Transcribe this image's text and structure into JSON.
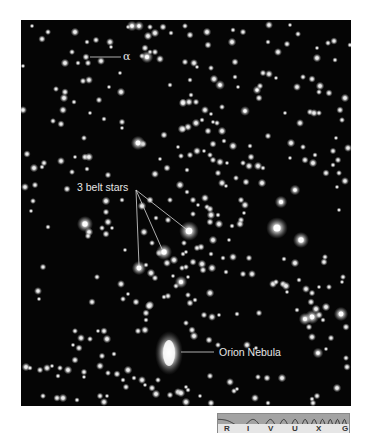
{
  "figure": {
    "labels": {
      "alpha": "α",
      "belt_stars": "3 belt stars",
      "nebula": "Orion Nebula"
    },
    "spectrum_bar": {
      "bands": [
        {
          "label": "R",
          "x": 6
        },
        {
          "label": "I",
          "x": 29
        },
        {
          "label": "V",
          "x": 50
        },
        {
          "label": "U",
          "x": 74
        },
        {
          "label": "X",
          "x": 98
        },
        {
          "label": "G",
          "x": 124
        }
      ],
      "colors": {
        "wave_bg": "#a3a3a3",
        "label_bg": "#e6e6e6",
        "wave_line": "#2a2a2a"
      }
    },
    "colors": {
      "sky": "#050505",
      "star": "#ffffff",
      "annotation": "#e6e6e6"
    },
    "bright_stars": [
      [
        189,
        231,
        5.5
      ],
      [
        164,
        252,
        4.5
      ],
      [
        139,
        268,
        4
      ],
      [
        277,
        228,
        6
      ],
      [
        301,
        240,
        4.5
      ],
      [
        281,
        202,
        3.5
      ],
      [
        295,
        190,
        3
      ],
      [
        85,
        224,
        4.5
      ],
      [
        147,
        57,
        3.5
      ],
      [
        138,
        143,
        4
      ],
      [
        312,
        317,
        4
      ],
      [
        305,
        319,
        3.5
      ],
      [
        341,
        314,
        4
      ],
      [
        181,
        282,
        3.5
      ],
      [
        132,
        26,
        3
      ],
      [
        318,
        353,
        3
      ],
      [
        139,
        26,
        2.8
      ],
      [
        257,
        90,
        2.5
      ],
      [
        245,
        111,
        2.8
      ],
      [
        220,
        85,
        2.8
      ]
    ],
    "stars": [
      [
        32,
        26
      ],
      [
        48,
        32
      ],
      [
        42,
        39
      ],
      [
        75,
        32
      ],
      [
        87,
        42
      ],
      [
        96,
        40
      ],
      [
        110,
        42
      ],
      [
        111,
        47
      ],
      [
        72,
        52
      ],
      [
        86,
        57
      ],
      [
        65,
        63
      ],
      [
        78,
        63
      ],
      [
        88,
        63
      ],
      [
        101,
        61
      ],
      [
        120,
        73
      ],
      [
        142,
        56
      ],
      [
        145,
        48
      ],
      [
        148,
        36
      ],
      [
        150,
        52
      ],
      [
        155,
        52
      ],
      [
        160,
        59
      ],
      [
        128,
        27
      ],
      [
        150,
        27
      ],
      [
        163,
        27
      ],
      [
        155,
        33
      ],
      [
        171,
        33
      ],
      [
        83,
        81
      ],
      [
        89,
        80
      ],
      [
        109,
        87
      ],
      [
        56,
        89
      ],
      [
        65,
        92
      ],
      [
        64,
        98
      ],
      [
        74,
        102
      ],
      [
        99,
        100
      ],
      [
        63,
        110
      ],
      [
        90,
        113
      ],
      [
        53,
        121
      ],
      [
        61,
        124
      ],
      [
        121,
        92
      ],
      [
        170,
        85
      ],
      [
        183,
        102
      ],
      [
        189,
        102
      ],
      [
        122,
        128
      ],
      [
        84,
        138
      ],
      [
        164,
        135
      ],
      [
        182,
        129
      ],
      [
        104,
        119
      ],
      [
        122,
        122
      ],
      [
        23,
        110
      ],
      [
        23,
        66
      ],
      [
        185,
        26
      ],
      [
        190,
        35
      ],
      [
        207,
        32
      ],
      [
        233,
        30
      ],
      [
        243,
        32
      ],
      [
        269,
        25
      ],
      [
        290,
        25
      ],
      [
        298,
        34
      ],
      [
        208,
        45
      ],
      [
        232,
        42
      ],
      [
        268,
        42
      ],
      [
        287,
        44
      ],
      [
        278,
        52
      ],
      [
        317,
        48
      ],
      [
        328,
        43
      ],
      [
        334,
        41
      ],
      [
        317,
        58
      ],
      [
        335,
        60
      ],
      [
        185,
        62
      ],
      [
        194,
        63
      ],
      [
        197,
        67
      ],
      [
        211,
        68
      ],
      [
        235,
        62
      ],
      [
        214,
        79
      ],
      [
        235,
        77
      ],
      [
        263,
        73
      ],
      [
        269,
        74
      ],
      [
        276,
        78
      ],
      [
        303,
        77
      ],
      [
        312,
        79
      ],
      [
        320,
        86
      ],
      [
        190,
        80
      ],
      [
        260,
        86
      ],
      [
        297,
        87
      ],
      [
        238,
        87
      ],
      [
        319,
        92
      ],
      [
        329,
        93
      ],
      [
        183,
        103
      ],
      [
        191,
        95
      ],
      [
        196,
        102
      ],
      [
        205,
        110
      ],
      [
        211,
        114
      ],
      [
        222,
        107
      ],
      [
        259,
        98
      ],
      [
        196,
        123
      ],
      [
        202,
        120
      ],
      [
        183,
        129
      ],
      [
        188,
        127
      ],
      [
        213,
        122
      ],
      [
        217,
        123
      ],
      [
        208,
        131
      ],
      [
        222,
        131
      ],
      [
        224,
        141
      ],
      [
        268,
        136
      ],
      [
        300,
        123
      ],
      [
        336,
        138
      ],
      [
        342,
        120
      ],
      [
        340,
        110
      ],
      [
        345,
        98
      ],
      [
        350,
        45
      ],
      [
        310,
        112
      ],
      [
        314,
        113
      ],
      [
        285,
        113
      ],
      [
        319,
        113
      ],
      [
        27,
        154
      ],
      [
        34,
        168
      ],
      [
        42,
        167
      ],
      [
        44,
        163
      ],
      [
        61,
        161
      ],
      [
        75,
        157
      ],
      [
        72,
        172
      ],
      [
        85,
        157
      ],
      [
        89,
        157
      ],
      [
        87,
        169
      ],
      [
        108,
        175
      ],
      [
        143,
        144
      ],
      [
        178,
        147
      ],
      [
        181,
        156
      ],
      [
        167,
        168
      ],
      [
        180,
        185
      ],
      [
        187,
        170
      ],
      [
        35,
        185
      ],
      [
        25,
        187
      ],
      [
        31,
        211
      ],
      [
        33,
        201
      ],
      [
        67,
        189
      ],
      [
        106,
        201
      ],
      [
        122,
        200
      ],
      [
        106,
        212
      ],
      [
        108,
        222
      ],
      [
        112,
        228
      ],
      [
        102,
        228
      ],
      [
        106,
        234
      ],
      [
        89,
        232
      ],
      [
        48,
        227
      ],
      [
        88,
        236
      ],
      [
        155,
        174
      ],
      [
        160,
        159
      ],
      [
        170,
        200
      ],
      [
        150,
        200
      ],
      [
        142,
        206
      ],
      [
        156,
        218
      ],
      [
        168,
        220
      ],
      [
        144,
        232
      ],
      [
        125,
        250
      ],
      [
        152,
        243
      ],
      [
        159,
        253
      ],
      [
        174,
        260
      ],
      [
        183,
        254
      ],
      [
        190,
        155
      ],
      [
        197,
        151
      ],
      [
        204,
        151
      ],
      [
        210,
        155
      ],
      [
        213,
        144
      ],
      [
        233,
        146
      ],
      [
        250,
        146
      ],
      [
        213,
        160
      ],
      [
        220,
        162
      ],
      [
        227,
        163
      ],
      [
        243,
        163
      ],
      [
        251,
        157
      ],
      [
        258,
        166
      ],
      [
        263,
        168
      ],
      [
        218,
        173
      ],
      [
        222,
        183
      ],
      [
        226,
        186
      ],
      [
        236,
        178
      ],
      [
        246,
        182
      ],
      [
        262,
        183
      ],
      [
        187,
        192
      ],
      [
        193,
        200
      ],
      [
        205,
        198
      ],
      [
        198,
        205
      ],
      [
        207,
        207
      ],
      [
        210,
        209
      ],
      [
        211,
        215
      ],
      [
        218,
        215
      ],
      [
        241,
        200
      ],
      [
        245,
        205
      ],
      [
        244,
        213
      ],
      [
        193,
        214
      ],
      [
        210,
        222
      ],
      [
        219,
        224
      ],
      [
        232,
        226
      ],
      [
        241,
        220
      ],
      [
        240,
        224
      ],
      [
        229,
        240
      ],
      [
        184,
        243
      ],
      [
        201,
        247
      ],
      [
        213,
        240
      ],
      [
        211,
        254
      ],
      [
        197,
        248
      ],
      [
        233,
        257
      ],
      [
        186,
        252
      ],
      [
        182,
        268
      ],
      [
        193,
        262
      ],
      [
        202,
        264
      ],
      [
        223,
        258
      ],
      [
        249,
        258
      ],
      [
        249,
        166
      ],
      [
        290,
        158
      ],
      [
        303,
        147
      ],
      [
        305,
        160
      ],
      [
        313,
        163
      ],
      [
        333,
        165
      ],
      [
        338,
        160
      ],
      [
        348,
        148
      ],
      [
        337,
        187
      ],
      [
        339,
        173
      ],
      [
        326,
        173
      ],
      [
        291,
        143
      ],
      [
        315,
        155
      ],
      [
        333,
        151
      ],
      [
        345,
        181
      ],
      [
        339,
        210
      ],
      [
        325,
        257
      ],
      [
        324,
        262
      ],
      [
        295,
        263
      ],
      [
        284,
        259
      ],
      [
        43,
        267
      ],
      [
        38,
        291
      ],
      [
        39,
        299
      ],
      [
        97,
        277
      ],
      [
        92,
        302
      ],
      [
        151,
        273
      ],
      [
        146,
        265
      ],
      [
        155,
        278
      ],
      [
        121,
        284
      ],
      [
        128,
        294
      ],
      [
        123,
        299
      ],
      [
        136,
        302
      ],
      [
        150,
        305
      ],
      [
        164,
        297
      ],
      [
        168,
        296
      ],
      [
        167,
        263
      ],
      [
        173,
        276
      ],
      [
        176,
        286
      ],
      [
        146,
        313
      ],
      [
        149,
        306
      ],
      [
        146,
        320
      ],
      [
        138,
        331
      ],
      [
        145,
        330
      ],
      [
        98,
        331
      ],
      [
        90,
        339
      ],
      [
        104,
        331
      ],
      [
        107,
        339
      ],
      [
        114,
        354
      ],
      [
        102,
        356
      ],
      [
        81,
        338
      ],
      [
        73,
        345
      ],
      [
        75,
        331
      ],
      [
        79,
        348
      ],
      [
        26,
        367
      ],
      [
        30,
        368
      ],
      [
        40,
        370
      ],
      [
        47,
        368
      ],
      [
        52,
        366
      ],
      [
        60,
        368
      ],
      [
        75,
        360
      ],
      [
        68,
        370
      ],
      [
        58,
        376
      ],
      [
        84,
        372
      ],
      [
        100,
        366
      ],
      [
        84,
        377
      ],
      [
        108,
        373
      ],
      [
        117,
        374
      ],
      [
        128,
        370
      ],
      [
        134,
        378
      ],
      [
        126,
        387
      ],
      [
        142,
        380
      ],
      [
        145,
        385
      ],
      [
        158,
        380
      ],
      [
        152,
        388
      ],
      [
        156,
        394
      ],
      [
        123,
        380
      ],
      [
        170,
        395
      ],
      [
        178,
        392
      ],
      [
        186,
        387
      ],
      [
        43,
        396
      ],
      [
        57,
        398
      ],
      [
        63,
        398
      ],
      [
        77,
        400
      ],
      [
        100,
        396
      ],
      [
        104,
        402
      ],
      [
        107,
        396
      ],
      [
        186,
        267
      ],
      [
        203,
        270
      ],
      [
        212,
        268
      ],
      [
        226,
        272
      ],
      [
        243,
        274
      ],
      [
        252,
        274
      ],
      [
        188,
        277
      ],
      [
        188,
        295
      ],
      [
        190,
        303
      ],
      [
        210,
        293
      ],
      [
        195,
        300
      ],
      [
        204,
        315
      ],
      [
        212,
        317
      ],
      [
        219,
        315
      ],
      [
        186,
        323
      ],
      [
        192,
        330
      ],
      [
        194,
        336
      ],
      [
        237,
        314
      ],
      [
        259,
        313
      ],
      [
        273,
        284
      ],
      [
        287,
        292
      ],
      [
        276,
        282
      ],
      [
        283,
        284
      ],
      [
        286,
        286
      ],
      [
        299,
        280
      ],
      [
        312,
        293
      ],
      [
        306,
        289
      ],
      [
        319,
        287
      ],
      [
        329,
        287
      ],
      [
        311,
        302
      ],
      [
        316,
        309
      ],
      [
        297,
        310
      ],
      [
        309,
        327
      ],
      [
        319,
        315
      ],
      [
        342,
        282
      ],
      [
        343,
        277
      ],
      [
        346,
        327
      ],
      [
        326,
        307
      ],
      [
        323,
        320
      ],
      [
        331,
        338
      ],
      [
        312,
        337
      ],
      [
        326,
        349
      ],
      [
        346,
        358
      ],
      [
        347,
        367
      ],
      [
        337,
        388
      ],
      [
        312,
        399
      ],
      [
        317,
        396
      ],
      [
        247,
        345
      ],
      [
        256,
        348
      ],
      [
        218,
        345
      ],
      [
        209,
        340
      ],
      [
        181,
        393
      ],
      [
        188,
        390
      ],
      [
        210,
        376
      ],
      [
        230,
        382
      ],
      [
        237,
        389
      ],
      [
        258,
        377
      ],
      [
        267,
        378
      ],
      [
        282,
        378
      ],
      [
        268,
        403
      ],
      [
        313,
        403
      ],
      [
        255,
        398
      ],
      [
        200,
        396
      ],
      [
        234,
        391
      ],
      [
        211,
        403
      ],
      [
        186,
        402
      ]
    ]
  }
}
